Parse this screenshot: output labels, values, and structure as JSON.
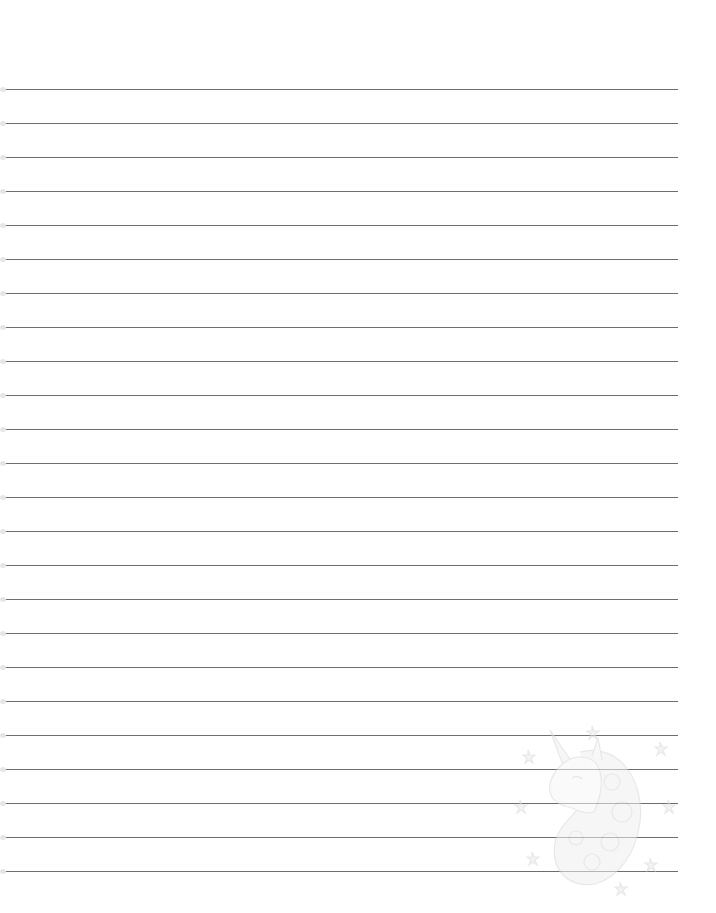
{
  "page": {
    "type": "lined-notebook-page",
    "background_color": "#ffffff",
    "line_color": "#6e6e6e",
    "line_count": 24,
    "first_line_y": 89,
    "line_spacing": 34,
    "line_left": 3,
    "line_right": 678
  },
  "watermark": {
    "icon": "unicorn-head-icon",
    "description": "Faint unicorn head with mane and stars, bottom-right",
    "color": "#e2e2e2"
  }
}
